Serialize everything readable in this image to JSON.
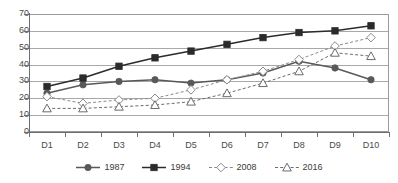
{
  "chart_data": {
    "type": "line",
    "title": "",
    "xlabel": "",
    "ylabel": "",
    "categories": [
      "D1",
      "D2",
      "D3",
      "D4",
      "D5",
      "D6",
      "D7",
      "D8",
      "D9",
      "D10"
    ],
    "ylim": [
      0,
      70
    ],
    "yticks": [
      0,
      10,
      20,
      30,
      40,
      50,
      60,
      70
    ],
    "ytick_labels": [
      "0",
      "10",
      "20",
      "30",
      "40",
      "50",
      "60",
      "70"
    ],
    "grid": true,
    "legend_position": "bottom",
    "series": [
      {
        "name": "1987",
        "marker": "filled-circle",
        "line_style": "solid",
        "color": "#595959",
        "values": [
          23,
          28,
          30,
          31,
          29,
          31,
          35,
          42,
          38,
          31
        ]
      },
      {
        "name": "1994",
        "marker": "filled-square",
        "line_style": "solid",
        "color": "#2b2b2b",
        "values": [
          27,
          32,
          39,
          44,
          48,
          52,
          56,
          59,
          60,
          63
        ]
      },
      {
        "name": "2008",
        "marker": "open-diamond",
        "line_style": "dashed",
        "color": "#8a8a8a",
        "values": [
          21,
          17,
          19,
          20,
          25,
          31,
          36,
          43,
          51,
          56
        ]
      },
      {
        "name": "2016",
        "marker": "open-triangle",
        "line_style": "dashed",
        "color": "#6b6b6b",
        "values": [
          14,
          14,
          15,
          16,
          18,
          23,
          29,
          36,
          47,
          45
        ]
      }
    ]
  },
  "legend": {
    "items": [
      {
        "label": "1987"
      },
      {
        "label": "1994"
      },
      {
        "label": "2008"
      },
      {
        "label": "2016"
      }
    ]
  }
}
